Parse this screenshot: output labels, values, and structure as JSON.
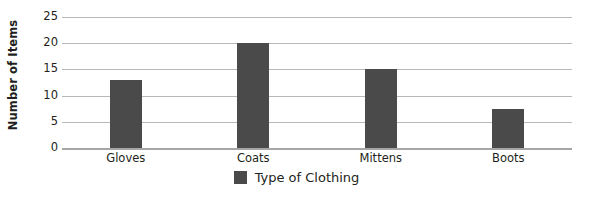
{
  "chart_data": {
    "type": "bar",
    "title": "",
    "categories": [
      "Gloves",
      "Coats",
      "Mittens",
      "Boots"
    ],
    "values": [
      13,
      20,
      15,
      7.5
    ],
    "series": [
      {
        "name": "Type of Clothing",
        "values": [
          13,
          20,
          15,
          7.5
        ]
      }
    ],
    "xlabel": "",
    "ylabel": "Number of Items",
    "ylim": [
      0,
      25
    ],
    "ytick_labels": [
      "25",
      "20",
      "15",
      "10",
      "5",
      "0"
    ],
    "ytick_values": [
      25,
      20,
      15,
      10,
      5,
      0
    ],
    "grid": true,
    "legend_position": "bottom"
  },
  "axes": {
    "y_title": "Number of Items"
  },
  "legend": {
    "swatch_name": "series-color-swatch",
    "label": "Type of Clothing"
  },
  "colors": {
    "bar_fill": "#4a4a4a",
    "gridline": "#b8b8b8",
    "axis_line": "#a6a6a6",
    "text": "#231f20",
    "background": "#ffffff"
  }
}
